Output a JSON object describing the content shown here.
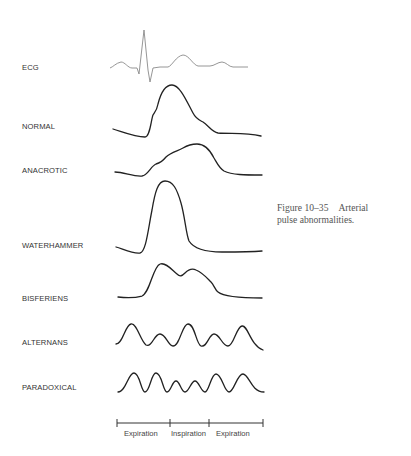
{
  "caption": {
    "figure_number": "Figure 10–35",
    "text_line1": "Arterial",
    "text_line2": "pulse abnormalities."
  },
  "waveforms": [
    {
      "label": "ECG"
    },
    {
      "label": "NORMAL"
    },
    {
      "label": "ANACROTIC"
    },
    {
      "label": "WATERHAMMER"
    },
    {
      "label": "BISFERIENS"
    },
    {
      "label": "ALTERNANS"
    },
    {
      "label": "PARADOXICAL"
    }
  ],
  "timeline": {
    "segments": [
      "Expiration",
      "Inspiration",
      "Expiration"
    ]
  },
  "colors": {
    "ecg_stroke": "#8a8a8a",
    "pulse_stroke": "#222222",
    "label_text": "#333333",
    "caption_text": "#555555"
  }
}
